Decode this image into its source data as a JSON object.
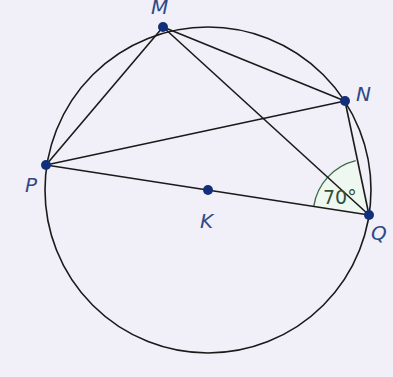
{
  "diagram": {
    "type": "circle-geometry",
    "colors": {
      "background": "#f1eff8",
      "line": "#1a1a1a",
      "point": "#12307a",
      "label": "#2d4a86",
      "angle_stroke": "#3d6b4c",
      "angle_fill": "#eef7f0"
    },
    "circle": {
      "center_label": "K",
      "cx": 208,
      "cy": 190,
      "r": 163
    },
    "points": [
      {
        "name": "M",
        "label": "M",
        "x": 163,
        "y": 27
      },
      {
        "name": "N",
        "label": "N",
        "x": 345,
        "y": 101
      },
      {
        "name": "P",
        "label": "P",
        "x": 46,
        "y": 165
      },
      {
        "name": "Q",
        "label": "Q",
        "x": 369,
        "y": 215
      },
      {
        "name": "K",
        "label": "K",
        "x": 208,
        "y": 190
      }
    ],
    "segments": [
      "PM",
      "MN",
      "MQ",
      "PN",
      "NQ",
      "PQ"
    ],
    "angle": {
      "vertex": "Q",
      "between": [
        "QP",
        "QN"
      ],
      "label": "70°"
    }
  }
}
